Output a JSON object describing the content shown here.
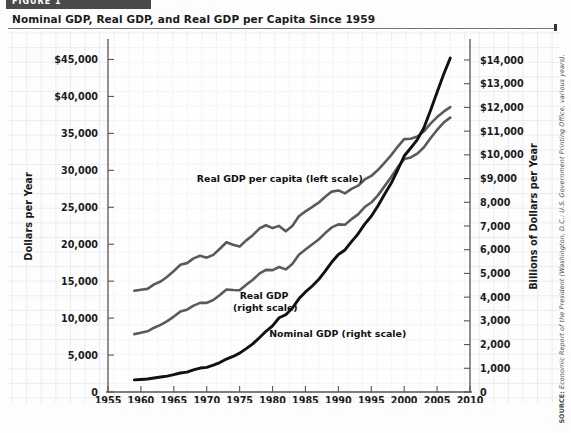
{
  "banner": {
    "label": "FIGURE 1"
  },
  "figure": {
    "title": "Nominal GDP, Real GDP, and Real GDP per Capita Since 1959",
    "source_prefix": "SOURCE:",
    "source_text": " Economic Report of the President (Washington, D.C.: U.S. Government Printing Office, various years)."
  },
  "chart_data": {
    "type": "line",
    "title": "Nominal GDP, Real GDP, and Real GDP per Capita Since 1959",
    "xlabel": "Year",
    "ylabel": "Dollars per Year",
    "y2label": "Billions of Dollars per Year",
    "xlim": [
      1955,
      2010
    ],
    "xticks": [
      1955,
      1960,
      1965,
      1970,
      1975,
      1980,
      1985,
      1990,
      1995,
      2000,
      2005,
      2010
    ],
    "ylim": [
      0,
      47500
    ],
    "yticks": [
      0,
      5000,
      10000,
      15000,
      20000,
      25000,
      30000,
      35000,
      40000,
      45000
    ],
    "yticklabels": [
      "0",
      "5,000",
      "10,000",
      "15,000",
      "20,000",
      "25,000",
      "30,000",
      "35,000",
      "$40,000",
      "$45,000"
    ],
    "y2lim": [
      0,
      14800
    ],
    "y2ticks": [
      0,
      1000,
      2000,
      3000,
      4000,
      5000,
      6000,
      7000,
      8000,
      9000,
      10000,
      11000,
      12000,
      13000,
      14000
    ],
    "y2ticklabels": [
      "0",
      "1,000",
      "2,000",
      "3,000",
      "4,000",
      "5,000",
      "6,000",
      "7,000",
      "8,000",
      "$9,000",
      "$10,000",
      "$11,000",
      "$12,000",
      "$13,000",
      "$14,000"
    ],
    "grid": true,
    "legend_position": "inline-annotations",
    "annotations": [
      {
        "text": "Real GDP per capita (left scale)",
        "x": 1968.5,
        "y_px": 182,
        "anchor": "start"
      },
      {
        "text": "Real GDP",
        "x": 1975.0,
        "y_px": 299,
        "anchor": "start"
      },
      {
        "text": "(right scale)",
        "x": 1974.0,
        "y_px": 311,
        "anchor": "start"
      },
      {
        "text": "Nominal GDP (right scale)",
        "x": 1979.5,
        "y_px": 337,
        "anchor": "start"
      }
    ],
    "series": [
      {
        "name": "Real GDP per capita (left scale)",
        "axis": "left",
        "color": "#5a5a5a",
        "width": 2.6,
        "x": [
          1959,
          1960,
          1961,
          1962,
          1963,
          1964,
          1965,
          1966,
          1967,
          1968,
          1969,
          1970,
          1971,
          1972,
          1973,
          1974,
          1975,
          1976,
          1977,
          1978,
          1979,
          1980,
          1981,
          1982,
          1983,
          1984,
          1985,
          1986,
          1987,
          1988,
          1989,
          1990,
          1991,
          1992,
          1993,
          1994,
          1995,
          1996,
          1997,
          1998,
          1999,
          2000,
          2001,
          2002,
          2003,
          2004,
          2005,
          2006,
          2007
        ],
        "values": [
          13700,
          13840,
          13960,
          14560,
          14960,
          15600,
          16380,
          17220,
          17440,
          18080,
          18440,
          18180,
          18560,
          19380,
          20260,
          19920,
          19680,
          20520,
          21220,
          22120,
          22560,
          22180,
          22480,
          21740,
          22460,
          23780,
          24440,
          25020,
          25620,
          26420,
          27120,
          27280,
          26880,
          27480,
          27920,
          28760,
          29240,
          30040,
          31020,
          32020,
          33180,
          34220,
          34280,
          34580,
          35280,
          36320,
          37200,
          37940,
          38560
        ]
      },
      {
        "name": "Real GDP (right scale)",
        "axis": "right",
        "color": "#5a5a5a",
        "width": 2.6,
        "x": [
          1959,
          1960,
          1961,
          1962,
          1963,
          1964,
          1965,
          1966,
          1967,
          1968,
          1969,
          1970,
          1971,
          1972,
          1973,
          1974,
          1975,
          1976,
          1977,
          1978,
          1979,
          1980,
          1981,
          1982,
          1983,
          1984,
          1985,
          1986,
          1987,
          1988,
          1989,
          1990,
          1991,
          1992,
          1993,
          1994,
          1995,
          1996,
          1997,
          1998,
          1999,
          2000,
          2001,
          2002,
          2003,
          2004,
          2005,
          2006,
          2007
        ],
        "values": [
          2440,
          2500,
          2560,
          2710,
          2830,
          2990,
          3180,
          3390,
          3470,
          3640,
          3760,
          3760,
          3880,
          4090,
          4320,
          4300,
          4290,
          4520,
          4730,
          4990,
          5150,
          5140,
          5270,
          5170,
          5400,
          5790,
          6010,
          6220,
          6430,
          6700,
          6940,
          7070,
          7050,
          7290,
          7490,
          7800,
          7990,
          8290,
          8670,
          9060,
          9470,
          9820,
          9890,
          10050,
          10320,
          10700,
          11050,
          11360,
          11570
        ]
      },
      {
        "name": "Nominal GDP (right scale)",
        "axis": "right",
        "color": "#111111",
        "width": 2.9,
        "x": [
          1959,
          1960,
          1961,
          1962,
          1963,
          1964,
          1965,
          1966,
          1967,
          1968,
          1969,
          1970,
          1971,
          1972,
          1973,
          1974,
          1975,
          1976,
          1977,
          1978,
          1979,
          1980,
          1981,
          1982,
          1983,
          1984,
          1985,
          1986,
          1987,
          1988,
          1989,
          1990,
          1991,
          1992,
          1993,
          1994,
          1995,
          1996,
          1997,
          1998,
          1999,
          2000,
          2001,
          2002,
          2003,
          2004,
          2005,
          2006,
          2007
        ],
        "values": [
          510,
          530,
          550,
          590,
          630,
          670,
          730,
          800,
          840,
          930,
          1010,
          1040,
          1130,
          1240,
          1390,
          1500,
          1640,
          1830,
          2030,
          2290,
          2560,
          2790,
          3130,
          3260,
          3530,
          3930,
          4220,
          4460,
          4740,
          5100,
          5480,
          5800,
          5990,
          6340,
          6670,
          7080,
          7410,
          7840,
          8330,
          8790,
          9350,
          9950,
          10290,
          10640,
          11140,
          11870,
          12640,
          13400,
          14080
        ]
      }
    ]
  }
}
